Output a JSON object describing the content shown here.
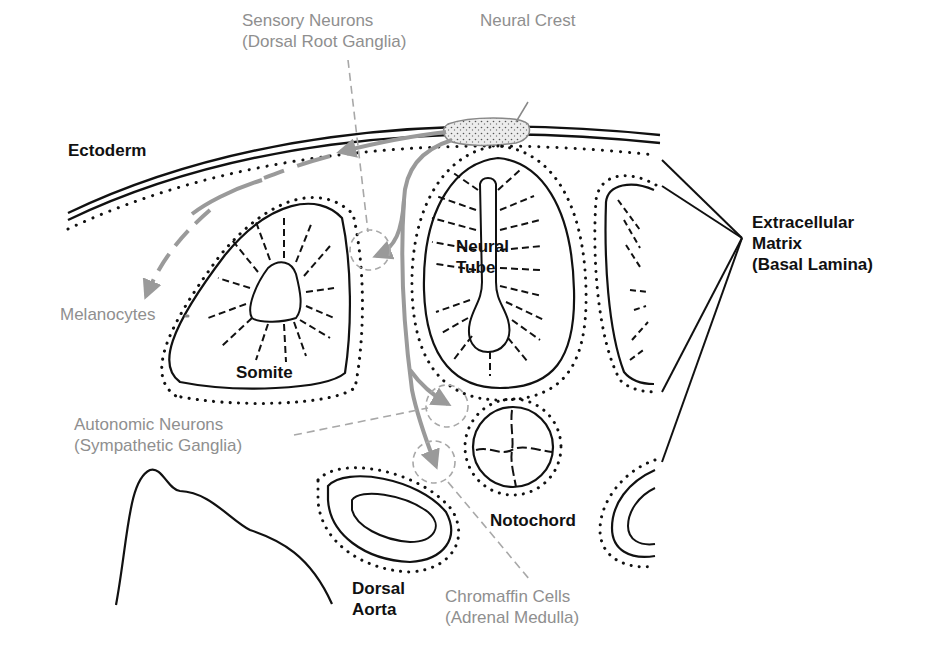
{
  "colors": {
    "structure": "#111111",
    "migration": "#9a9a9a",
    "derivative_label": "#8f8f8f",
    "crest_fill": "#d9d9d9"
  },
  "labels": {
    "ectoderm": "Ectoderm",
    "neural_crest": "Neural Crest",
    "sensory_neurons": [
      "Sensory Neurons",
      "(Dorsal Root Ganglia)"
    ],
    "melanocytes": "Melanocytes",
    "somite": "Somite",
    "neural_tube": [
      "Neural",
      "Tube"
    ],
    "extracellular_matrix": [
      "Extracellular",
      "Matrix",
      "(Basal Lamina)"
    ],
    "autonomic_neurons": [
      "Autonomic Neurons",
      "(Sympathetic Ganglia)"
    ],
    "notochord": "Notochord",
    "dorsal_aorta": [
      "Dorsal",
      "Aorta"
    ],
    "chromaffin_cells": [
      "Chromaffin Cells",
      "(Adrenal Medulla)"
    ]
  }
}
